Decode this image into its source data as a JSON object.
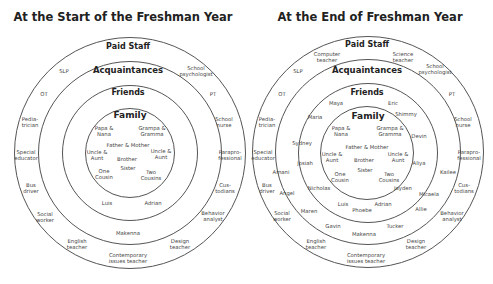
{
  "left": {
    "title": "At the Start of the Freshman Year",
    "rings": {
      "paid_staff": "Paid Staff",
      "acquaintances": "Acquaintances",
      "friends": "Friends",
      "family": "Family"
    },
    "family": [
      "Papa &\nNana",
      "Grampa &\nGramma",
      "Father & Mother",
      "Uncle &\nAunt",
      "Brother",
      "Uncle &\nAunt",
      "One\nCousin",
      "Sister",
      "Two\nCousins"
    ],
    "friends": [
      "Luis",
      "Adrian"
    ],
    "acquaintances": [
      "Makenna"
    ],
    "paid_staff": [
      "SLP",
      "School\npsychologist",
      "OT",
      "PT",
      "Pedia-\ntrician",
      "School\nnurse",
      "Special\neducator",
      "Parapro-\nfessional",
      "Bus\ndriver",
      "Cus-\ntodians",
      "Social\nworker",
      "Behavior\nanalyst",
      "English\nteacher",
      "Design\nteacher",
      "Contemporary\nissues teacher"
    ]
  },
  "right": {
    "title": "At the End of Freshman Year",
    "rings": {
      "paid_staff": "Paid Staff",
      "acquaintances": "Acquaintances",
      "friends": "Friends",
      "family": "Family"
    },
    "family": [
      "Papa &\nNana",
      "Grampa &\nGramma",
      "Father & Mother",
      "Uncle &\nAunt",
      "Brother",
      "Uncle &\nAunt",
      "One\nCousin",
      "Sister",
      "Two\nCousins"
    ],
    "friends": [
      "Maya",
      "Eric",
      "Maria",
      "Shimmy",
      "Sydney",
      "Devin",
      "Josiah",
      "Aliya",
      "Nicholas",
      "Jayden",
      "Luis",
      "Adrian",
      "Phoebe"
    ],
    "acquaintances": [
      "Amani",
      "Kailee",
      "Angel",
      "Micaela",
      "Maren",
      "Allie",
      "Gavin",
      "Tucker",
      "Makenna"
    ],
    "paid_staff": [
      "Computer\nteacher",
      "Science\nteacher",
      "SLP",
      "School\npsychologist",
      "OT",
      "PT",
      "Pedia-\ntrician",
      "School\nnurse",
      "Special\neducator",
      "Parapro-\nfessional",
      "Bus\ndriver",
      "Cus-\ntodians",
      "Social\nworker",
      "Behavior\nanalyst",
      "English\nteacher",
      "Design\nteacher",
      "Contemporary\nissues teacher"
    ]
  }
}
